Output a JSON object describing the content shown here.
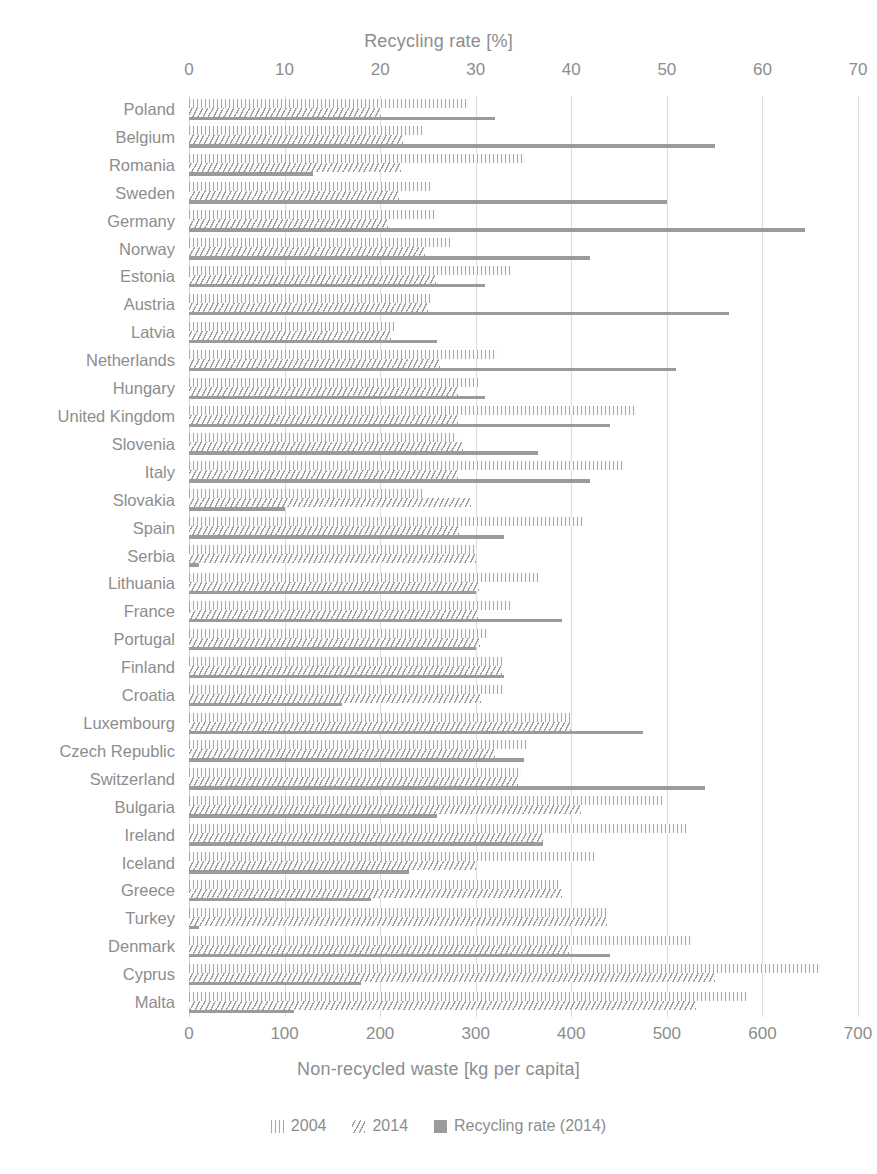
{
  "chart_data": {
    "type": "bar",
    "orientation": "horizontal",
    "title": "",
    "top_axis": {
      "label": "Recycling rate [%]",
      "ticks": [
        0,
        10,
        20,
        30,
        40,
        50,
        60,
        70
      ],
      "range": [
        0,
        70
      ]
    },
    "bottom_axis": {
      "label": "Non-recycled waste [kg per capita]",
      "ticks": [
        0,
        100,
        200,
        300,
        400,
        500,
        600,
        700
      ],
      "range": [
        0,
        700
      ]
    },
    "grid": true,
    "legend_position": "bottom",
    "legend": [
      {
        "name": "2004",
        "pattern": "vertical-hatch"
      },
      {
        "name": "2014",
        "pattern": "diagonal-hatch"
      },
      {
        "name": "Recycling rate (2014)",
        "pattern": "solid"
      }
    ],
    "categories": [
      "Poland",
      "Belgium",
      "Romania",
      "Sweden",
      "Germany",
      "Norway",
      "Estonia",
      "Austria",
      "Latvia",
      "Netherlands",
      "Hungary",
      "United Kingdom",
      "Slovenia",
      "Italy",
      "Slovakia",
      "Spain",
      "Serbia",
      "Lithuania",
      "France",
      "Portugal",
      "Finland",
      "Croatia",
      "Luxembourg",
      "Czech Republic",
      "Switzerland",
      "Bulgaria",
      "Ireland",
      "Iceland",
      "Greece",
      "Turkey",
      "Denmark",
      "Cyprus",
      "Malta"
    ],
    "series": [
      {
        "name": "2004",
        "axis": "bottom",
        "unit": "kg per capita",
        "values": [
          293,
          245,
          352,
          254,
          257,
          273,
          337,
          254,
          214,
          322,
          302,
          468,
          280,
          455,
          244,
          412,
          300,
          365,
          338,
          313,
          327,
          330,
          399,
          355,
          347,
          495,
          521,
          424,
          387,
          438,
          527,
          660,
          585
        ]
      },
      {
        "name": "2014",
        "axis": "bottom",
        "unit": "kg per capita",
        "values": [
          201,
          224,
          222,
          220,
          208,
          247,
          258,
          250,
          211,
          263,
          281,
          281,
          287,
          281,
          295,
          283,
          300,
          303,
          302,
          305,
          327,
          306,
          400,
          320,
          344,
          410,
          370,
          300,
          390,
          437,
          398,
          550,
          530
        ]
      },
      {
        "name": "Recycling rate (2014)",
        "axis": "top",
        "unit": "%",
        "values": [
          32,
          55,
          13,
          50,
          64.5,
          42,
          31,
          56.5,
          26,
          51,
          31,
          44,
          36.5,
          42,
          10,
          33,
          1,
          30,
          39,
          30,
          33,
          16,
          47.5,
          35,
          54,
          26,
          37,
          23,
          19,
          1,
          44,
          18,
          11
        ]
      }
    ]
  }
}
